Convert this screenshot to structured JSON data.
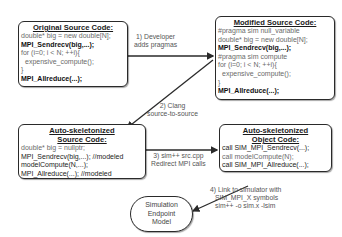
{
  "boxes": {
    "original": {
      "title": "Original Source Code:",
      "lines": [
        {
          "text": "double* big = new double[N];",
          "style": "gray"
        },
        {
          "text": "MPI_Sendrecv(big,...);",
          "style": "dark"
        },
        {
          "text": "for (i=0; i < N; ++i){",
          "style": "gray"
        },
        {
          "text": "expensive_compute();",
          "style": "gray-indent"
        },
        {
          "text": "}",
          "style": "gray"
        },
        {
          "text": "MPI_Allreduce(...);",
          "style": "dark"
        }
      ]
    },
    "modified": {
      "title": "Modified Source Code:",
      "lines": [
        {
          "text": "#pragma sim null_variable",
          "style": "gray"
        },
        {
          "text": "double* big = new double[N];",
          "style": "gray"
        },
        {
          "text": "MPI_Sendrecv(big,...);",
          "style": "dark"
        },
        {
          "text": "#pragma sim compute",
          "style": "gray"
        },
        {
          "text": "for (i=0; i < N; ++i){",
          "style": "gray"
        },
        {
          "text": "expensive_compute();",
          "style": "gray-indent"
        },
        {
          "text": "}",
          "style": "gray"
        },
        {
          "text": "MPI_Allreduce(...);",
          "style": "dark"
        }
      ]
    },
    "skeleton_source": {
      "title_line1": "Auto-skeletonized",
      "title_line2": "Source Code:",
      "lines": [
        {
          "text": "double* big = nullptr;",
          "style": "gray"
        },
        {
          "text": "MPI_Sendrecv(big,...); //modeled",
          "style": "dark-mixed"
        },
        {
          "text": "modelCompute(N,...);",
          "style": "dark"
        },
        {
          "text": "MPI_Allreduce(...); //modeled",
          "style": "dark-mixed"
        }
      ]
    },
    "skeleton_object": {
      "title_line1": "Auto-skeletonized",
      "title_line2": "Object Code:",
      "lines": [
        {
          "text": "call SIM_MPI_Sendrecv(...);",
          "style": "dark"
        },
        {
          "text": "call modelCompute(N);",
          "style": "gray"
        },
        {
          "text": "call SIM_MPI_Allreduce(...);",
          "style": "dark"
        }
      ]
    },
    "simulation": {
      "lines": [
        "Simulation",
        "Endpoint",
        "Model"
      ]
    }
  },
  "steps": {
    "step1": [
      "1) Developer",
      "adds pragmas"
    ],
    "step2": [
      "2) Clang",
      "source-to-source"
    ],
    "step3": [
      "3) sim++ src.cpp",
      "Redirect MPI calls"
    ],
    "step4": [
      "4) Link to simulator with",
      "SIM_MPI_X symbols",
      "sim++ -o sim.x -lsim"
    ]
  }
}
